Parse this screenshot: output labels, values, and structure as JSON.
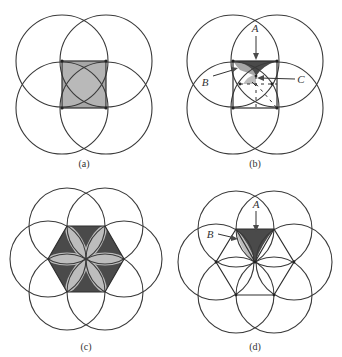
{
  "figure": {
    "panels": [
      {
        "id": "a",
        "caption": "(a)",
        "description": "Four circles centered at the corners of a square; square region shaded with overlapping lens petals"
      },
      {
        "id": "b",
        "caption": "(b)",
        "description": "Four circles centered at square corners with labeled regions A, B, C",
        "labels": {
          "A": "A",
          "B": "B",
          "C": "C"
        }
      },
      {
        "id": "c",
        "caption": "(c)",
        "description": "Six circles centered at vertices of a regular hexagon; hexagon shaded with six lens petals"
      },
      {
        "id": "d",
        "caption": "(d)",
        "description": "Six circles centered at hexagon vertices with labeled regions A and B",
        "labels": {
          "A": "A",
          "B": "B"
        }
      }
    ],
    "colors": {
      "stroke": "#3a3a3a",
      "dark_fill": "#4a4a4a",
      "light_fill": "#bdbdbd",
      "background": "#ffffff"
    }
  }
}
